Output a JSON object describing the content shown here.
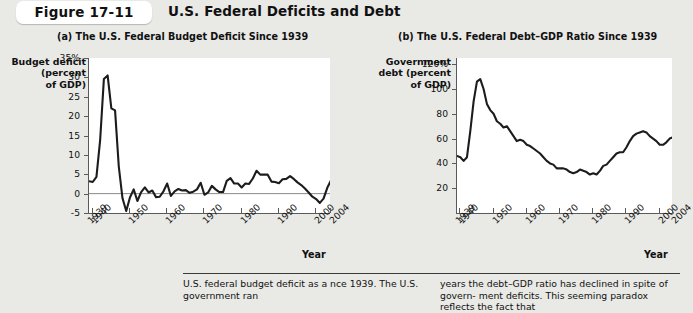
{
  "header": {
    "figure_label": "Figure 17-11",
    "title": "U.S. Federal Deficits and Debt"
  },
  "panels": {
    "a": {
      "title": "(a) The U.S. Federal Budget Deficit Since 1939",
      "y_axis_title": "Budget deficit\n(percent\nof GDP)",
      "x_axis_title": "Year"
    },
    "b": {
      "title": "(b) The U.S. Federal Debt–GDP Ratio Since 1939",
      "y_axis_title": "Government\ndebt (percent\nof GDP)",
      "x_axis_title": "Year"
    }
  },
  "caption": {
    "left": "U.S. federal budget deficit as a\nnce 1939. The U.S. government ran",
    "right": "years the debt–GDP ratio has declined in spite of govern-\nment deficits. This seeming paradox reflects the fact that"
  },
  "chart_data": [
    {
      "id": "panel-a",
      "type": "line",
      "title": "(a) The U.S. Federal Budget Deficit Since 1939",
      "xlabel": "Year",
      "ylabel": "Budget deficit (percent of GDP)",
      "xlim": [
        1939,
        2004
      ],
      "ylim": [
        -5,
        35
      ],
      "ytick_labels": [
        "35%",
        "30",
        "25",
        "20",
        "15",
        "10",
        "5",
        "0",
        "-5"
      ],
      "yticks": [
        35,
        30,
        25,
        20,
        15,
        10,
        5,
        0,
        -5
      ],
      "xtick_labels": [
        "1939",
        "1940",
        "1950",
        "1960",
        "1970",
        "1980",
        "1990",
        "2000",
        "2004"
      ],
      "xticks": [
        1939,
        1940,
        1950,
        1960,
        1970,
        1980,
        1990,
        2000,
        2004
      ],
      "grid": false,
      "legend": "none",
      "x": [
        1939,
        1940,
        1941,
        1942,
        1943,
        1944,
        1945,
        1946,
        1947,
        1948,
        1949,
        1950,
        1951,
        1952,
        1953,
        1954,
        1955,
        1956,
        1957,
        1958,
        1959,
        1960,
        1961,
        1962,
        1963,
        1964,
        1965,
        1966,
        1967,
        1968,
        1969,
        1970,
        1971,
        1972,
        1973,
        1974,
        1975,
        1976,
        1977,
        1978,
        1979,
        1980,
        1981,
        1982,
        1983,
        1984,
        1985,
        1986,
        1987,
        1988,
        1989,
        1990,
        1991,
        1992,
        1993,
        1994,
        1995,
        1996,
        1997,
        1998,
        1999,
        2000,
        2001,
        2002,
        2003,
        2004
      ],
      "values": [
        3.2,
        3.0,
        4.3,
        13.9,
        29.6,
        30.5,
        22.0,
        21.5,
        7.0,
        -1.2,
        -4.5,
        -1.0,
        1.1,
        -1.9,
        0.4,
        1.6,
        0.3,
        0.8,
        -0.9,
        -0.8,
        0.6,
        2.6,
        -0.6,
        0.6,
        1.2,
        0.8,
        0.9,
        0.2,
        0.5,
        1.1,
        2.8,
        -0.3,
        0.3,
        2.0,
        1.1,
        0.4,
        0.4,
        3.3,
        4.0,
        2.6,
        2.6,
        1.6,
        2.6,
        2.5,
        3.9,
        5.9,
        4.9,
        4.9,
        4.9,
        3.1,
        3.0,
        2.7,
        3.7,
        3.8,
        4.5,
        3.8,
        2.9,
        2.2,
        1.3,
        0.3,
        -0.8,
        -1.4,
        -2.4,
        -1.3,
        1.5,
        3.4
      ]
    },
    {
      "id": "panel-b",
      "type": "line",
      "title": "(b) The U.S. Federal Debt–GDP Ratio Since 1939",
      "xlabel": "Year",
      "ylabel": "Government debt (percent of GDP)",
      "xlim": [
        1939,
        2004
      ],
      "ylim": [
        0,
        125
      ],
      "ytick_labels": [
        "120%",
        "100",
        "80",
        "60",
        "40",
        "20"
      ],
      "yticks": [
        120,
        100,
        80,
        60,
        40,
        20
      ],
      "xtick_labels": [
        "1939",
        "1940",
        "1950",
        "1960",
        "1970",
        "1980",
        "1990",
        "2000",
        "2004"
      ],
      "xticks": [
        1939,
        1940,
        1950,
        1960,
        1970,
        1980,
        1990,
        2000,
        2004
      ],
      "grid": false,
      "legend": "none",
      "x": [
        1939,
        1940,
        1941,
        1942,
        1943,
        1944,
        1945,
        1946,
        1947,
        1948,
        1949,
        1950,
        1951,
        1952,
        1953,
        1954,
        1955,
        1956,
        1957,
        1958,
        1959,
        1960,
        1961,
        1962,
        1963,
        1964,
        1965,
        1966,
        1967,
        1968,
        1969,
        1970,
        1971,
        1972,
        1973,
        1974,
        1975,
        1976,
        1977,
        1978,
        1979,
        1980,
        1981,
        1982,
        1983,
        1984,
        1985,
        1986,
        1987,
        1988,
        1989,
        1990,
        1991,
        1992,
        1993,
        1994,
        1995,
        1996,
        1997,
        1998,
        1999,
        2000,
        2001,
        2002,
        2003,
        2004
      ],
      "values": [
        46,
        45,
        42,
        45,
        66,
        90,
        106,
        108,
        100,
        88,
        83,
        80,
        74,
        72,
        69,
        70,
        66,
        62,
        58,
        59,
        58,
        55,
        54,
        52,
        50,
        48,
        45,
        42,
        40,
        39,
        36,
        36,
        36,
        35,
        33,
        32,
        33,
        35,
        34,
        33,
        31,
        32,
        31,
        34,
        38,
        39,
        42,
        45,
        48,
        49,
        49,
        53,
        58,
        62,
        64,
        65,
        66,
        65,
        62,
        60,
        58,
        55,
        55,
        57,
        60,
        61
      ]
    }
  ]
}
